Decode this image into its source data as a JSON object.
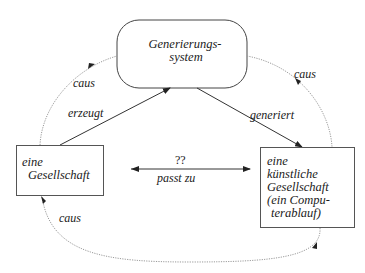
{
  "nodes": {
    "generator": {
      "line1": "Generierungs-",
      "line2": "system"
    },
    "society": {
      "line1": "eine",
      "line2": "Gesellschaft"
    },
    "artificial": {
      "line1": "eine",
      "line2": "künstliche",
      "line3": "Gesellschaft",
      "line4": "(ein Compu-",
      "line5": "terablauf)"
    }
  },
  "edges": {
    "erzeugt": "erzeugt",
    "generiert": "generiert",
    "match_top": "??",
    "match_bottom": "passt zu",
    "caus_top_left": "caus",
    "caus_top_right": "caus",
    "caus_bottom": "caus"
  },
  "colors": {
    "line": "#333333",
    "dotted": "#9a9a9a",
    "box_border": "#555555"
  }
}
